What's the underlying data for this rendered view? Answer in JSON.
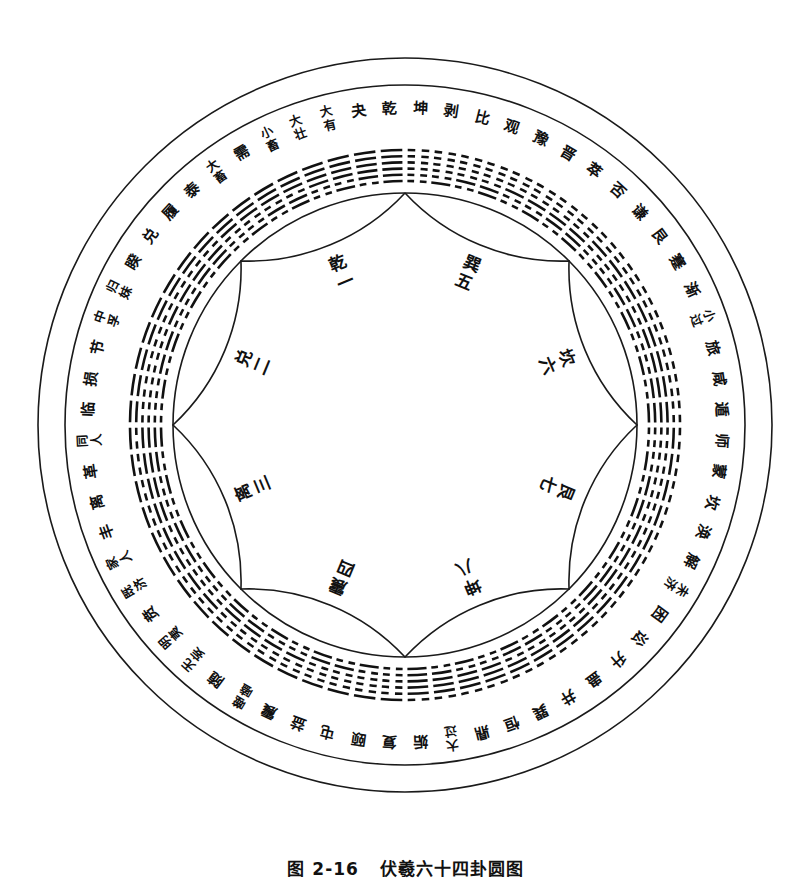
{
  "figure": {
    "caption": "图 2-16   伏羲六十四卦圆图",
    "caption_number": "图 2-16",
    "caption_title": "伏羲六十四卦圆图",
    "background_color": "#ffffff",
    "ink_color": "#111111"
  },
  "geometry": {
    "center_x": 405,
    "center_y": 425,
    "outer_radius": 367,
    "ring_outer_radius": 340,
    "ring_inner_radius": 232,
    "name_radius": 317,
    "hex_radius": 262,
    "inner_petal_radius": 232,
    "trigram_label_radius": 165
  },
  "inner_trigrams": [
    {
      "label": "乾一",
      "name": "乾",
      "number": "一",
      "angle_deg": 112.5
    },
    {
      "label": "兑二",
      "name": "兑",
      "number": "二",
      "angle_deg": 157.5
    },
    {
      "label": "离三",
      "name": "离",
      "number": "三",
      "angle_deg": 202.5
    },
    {
      "label": "震四",
      "name": "震",
      "number": "四",
      "angle_deg": 247.5
    },
    {
      "label": "巽五",
      "name": "巽",
      "number": "五",
      "angle_deg": 67.5
    },
    {
      "label": "坎六",
      "name": "坎",
      "number": "六",
      "angle_deg": 22.5
    },
    {
      "label": "艮七",
      "name": "艮",
      "number": "七",
      "angle_deg": 337.5
    },
    {
      "label": "坤八",
      "name": "坤",
      "number": "八",
      "angle_deg": 292.5
    }
  ],
  "hexagrams": [
    {
      "index": 1,
      "name": "乾",
      "lines": [
        1,
        1,
        1,
        1,
        1,
        1
      ]
    },
    {
      "index": 2,
      "name": "夬",
      "lines": [
        0,
        1,
        1,
        1,
        1,
        1
      ]
    },
    {
      "index": 3,
      "name": "大有",
      "lines": [
        1,
        0,
        1,
        1,
        1,
        1
      ]
    },
    {
      "index": 4,
      "name": "大壮",
      "lines": [
        0,
        0,
        1,
        1,
        1,
        1
      ]
    },
    {
      "index": 5,
      "name": "小畜",
      "lines": [
        1,
        1,
        0,
        1,
        1,
        1
      ]
    },
    {
      "index": 6,
      "name": "需",
      "lines": [
        0,
        1,
        0,
        1,
        1,
        1
      ]
    },
    {
      "index": 7,
      "name": "大畜",
      "lines": [
        1,
        0,
        0,
        1,
        1,
        1
      ]
    },
    {
      "index": 8,
      "name": "泰",
      "lines": [
        0,
        0,
        0,
        1,
        1,
        1
      ]
    },
    {
      "index": 9,
      "name": "履",
      "lines": [
        1,
        1,
        1,
        0,
        1,
        1
      ]
    },
    {
      "index": 10,
      "name": "兑",
      "lines": [
        0,
        1,
        1,
        0,
        1,
        1
      ]
    },
    {
      "index": 11,
      "name": "睽",
      "lines": [
        1,
        0,
        1,
        0,
        1,
        1
      ]
    },
    {
      "index": 12,
      "name": "归妹",
      "lines": [
        0,
        0,
        1,
        0,
        1,
        1
      ]
    },
    {
      "index": 13,
      "name": "中孚",
      "lines": [
        1,
        1,
        0,
        0,
        1,
        1
      ]
    },
    {
      "index": 14,
      "name": "节",
      "lines": [
        0,
        1,
        0,
        0,
        1,
        1
      ]
    },
    {
      "index": 15,
      "name": "损",
      "lines": [
        1,
        0,
        0,
        0,
        1,
        1
      ]
    },
    {
      "index": 16,
      "name": "临",
      "lines": [
        0,
        0,
        0,
        0,
        1,
        1
      ]
    },
    {
      "index": 17,
      "name": "同人",
      "lines": [
        1,
        1,
        1,
        1,
        0,
        1
      ]
    },
    {
      "index": 18,
      "name": "革",
      "lines": [
        0,
        1,
        1,
        1,
        0,
        1
      ]
    },
    {
      "index": 19,
      "name": "离",
      "lines": [
        1,
        0,
        1,
        1,
        0,
        1
      ]
    },
    {
      "index": 20,
      "name": "丰",
      "lines": [
        0,
        0,
        1,
        1,
        0,
        1
      ]
    },
    {
      "index": 21,
      "name": "家人",
      "lines": [
        1,
        1,
        0,
        1,
        0,
        1
      ]
    },
    {
      "index": 22,
      "name": "既济",
      "lines": [
        0,
        1,
        0,
        1,
        0,
        1
      ]
    },
    {
      "index": 23,
      "name": "贲",
      "lines": [
        1,
        0,
        0,
        1,
        0,
        1
      ]
    },
    {
      "index": 24,
      "name": "明夷",
      "lines": [
        0,
        0,
        0,
        1,
        0,
        1
      ]
    },
    {
      "index": 25,
      "name": "无妄",
      "lines": [
        1,
        1,
        1,
        0,
        0,
        1
      ]
    },
    {
      "index": 26,
      "name": "随",
      "lines": [
        0,
        1,
        1,
        0,
        0,
        1
      ]
    },
    {
      "index": 27,
      "name": "噬嗑",
      "lines": [
        1,
        0,
        1,
        0,
        0,
        1
      ]
    },
    {
      "index": 28,
      "name": "震",
      "lines": [
        0,
        0,
        1,
        0,
        0,
        1
      ]
    },
    {
      "index": 29,
      "name": "益",
      "lines": [
        1,
        1,
        0,
        0,
        0,
        1
      ]
    },
    {
      "index": 30,
      "name": "屯",
      "lines": [
        0,
        1,
        0,
        0,
        0,
        1
      ]
    },
    {
      "index": 31,
      "name": "颐",
      "lines": [
        1,
        0,
        0,
        0,
        0,
        1
      ]
    },
    {
      "index": 32,
      "name": "复",
      "lines": [
        0,
        0,
        0,
        0,
        0,
        1
      ]
    },
    {
      "index": 33,
      "name": "姤",
      "lines": [
        1,
        1,
        1,
        1,
        1,
        0
      ]
    },
    {
      "index": 34,
      "name": "大过",
      "lines": [
        0,
        1,
        1,
        1,
        1,
        0
      ]
    },
    {
      "index": 35,
      "name": "鼎",
      "lines": [
        1,
        0,
        1,
        1,
        1,
        0
      ]
    },
    {
      "index": 36,
      "name": "恒",
      "lines": [
        0,
        0,
        1,
        1,
        1,
        0
      ]
    },
    {
      "index": 37,
      "name": "巽",
      "lines": [
        1,
        1,
        0,
        1,
        1,
        0
      ]
    },
    {
      "index": 38,
      "name": "井",
      "lines": [
        0,
        1,
        0,
        1,
        1,
        0
      ]
    },
    {
      "index": 39,
      "name": "蛊",
      "lines": [
        1,
        0,
        0,
        1,
        1,
        0
      ]
    },
    {
      "index": 40,
      "name": "升",
      "lines": [
        0,
        0,
        0,
        1,
        1,
        0
      ]
    },
    {
      "index": 41,
      "name": "讼",
      "lines": [
        1,
        1,
        1,
        0,
        1,
        0
      ]
    },
    {
      "index": 42,
      "name": "困",
      "lines": [
        0,
        1,
        1,
        0,
        1,
        0
      ]
    },
    {
      "index": 43,
      "name": "未济",
      "lines": [
        1,
        0,
        1,
        0,
        1,
        0
      ]
    },
    {
      "index": 44,
      "name": "解",
      "lines": [
        0,
        0,
        1,
        0,
        1,
        0
      ]
    },
    {
      "index": 45,
      "name": "涣",
      "lines": [
        1,
        1,
        0,
        0,
        1,
        0
      ]
    },
    {
      "index": 46,
      "name": "坎",
      "lines": [
        0,
        1,
        0,
        0,
        1,
        0
      ]
    },
    {
      "index": 47,
      "name": "蒙",
      "lines": [
        1,
        0,
        0,
        0,
        1,
        0
      ]
    },
    {
      "index": 48,
      "name": "师",
      "lines": [
        0,
        0,
        0,
        0,
        1,
        0
      ]
    },
    {
      "index": 49,
      "name": "遁",
      "lines": [
        1,
        1,
        1,
        1,
        0,
        0
      ]
    },
    {
      "index": 50,
      "name": "咸",
      "lines": [
        0,
        1,
        1,
        1,
        0,
        0
      ]
    },
    {
      "index": 51,
      "name": "旅",
      "lines": [
        1,
        0,
        1,
        1,
        0,
        0
      ]
    },
    {
      "index": 52,
      "name": "小过",
      "lines": [
        0,
        0,
        1,
        1,
        0,
        0
      ]
    },
    {
      "index": 53,
      "name": "渐",
      "lines": [
        1,
        1,
        0,
        1,
        0,
        0
      ]
    },
    {
      "index": 54,
      "name": "蹇",
      "lines": [
        0,
        1,
        0,
        1,
        0,
        0
      ]
    },
    {
      "index": 55,
      "name": "艮",
      "lines": [
        1,
        0,
        0,
        1,
        0,
        0
      ]
    },
    {
      "index": 56,
      "name": "谦",
      "lines": [
        0,
        0,
        0,
        1,
        0,
        0
      ]
    },
    {
      "index": 57,
      "name": "否",
      "lines": [
        1,
        1,
        1,
        0,
        0,
        0
      ]
    },
    {
      "index": 58,
      "name": "萃",
      "lines": [
        0,
        1,
        1,
        0,
        0,
        0
      ]
    },
    {
      "index": 59,
      "name": "晋",
      "lines": [
        1,
        0,
        1,
        0,
        0,
        0
      ]
    },
    {
      "index": 60,
      "name": "豫",
      "lines": [
        0,
        0,
        1,
        0,
        0,
        0
      ]
    },
    {
      "index": 61,
      "name": "观",
      "lines": [
        1,
        1,
        0,
        0,
        0,
        0
      ]
    },
    {
      "index": 62,
      "name": "比",
      "lines": [
        0,
        1,
        0,
        0,
        0,
        0
      ]
    },
    {
      "index": 63,
      "name": "剥",
      "lines": [
        1,
        0,
        0,
        0,
        0,
        0
      ]
    },
    {
      "index": 64,
      "name": "坤",
      "lines": [
        0,
        0,
        0,
        0,
        0,
        0
      ]
    }
  ]
}
